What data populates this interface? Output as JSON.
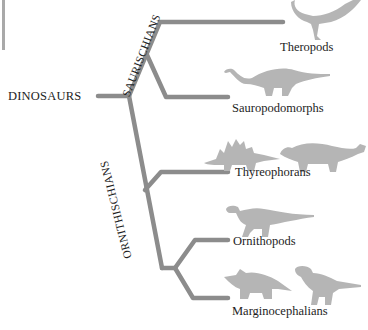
{
  "diagram": {
    "root": "DINOSAURS",
    "clades": [
      {
        "label": "SAURISCHIANS",
        "children": [
          "Theropods",
          "Sauropodomorphs"
        ]
      },
      {
        "label": "ORNITHISCHIANS",
        "children": [
          "Thyreophorans",
          "Ornithopods",
          "Marginocephalians"
        ]
      }
    ],
    "leaves": {
      "theropods": "Theropods",
      "sauropodomorphs": "Sauropodomorphs",
      "thyreophorans": "Thyreophorans",
      "ornithopods": "Ornithopods",
      "marginocephalians": "Marginocephalians"
    },
    "silhouettes": {
      "theropods": [
        "theropod-icon"
      ],
      "sauropodomorphs": [
        "sauropod-icon"
      ],
      "thyreophorans": [
        "stegosaurus-icon",
        "ankylosaurus-icon"
      ],
      "ornithopods": [
        "hadrosaur-icon"
      ],
      "marginocephalians": [
        "triceratops-icon",
        "pachycephalosaurus-icon"
      ]
    },
    "colors": {
      "branch": "#8c8c8c",
      "silhouette": "#b5b5b5",
      "text": "#1d1d1d"
    }
  }
}
